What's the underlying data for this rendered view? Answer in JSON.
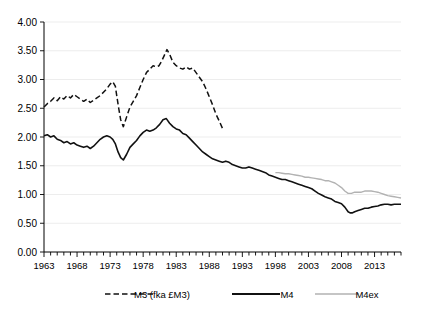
{
  "chart_data": {
    "type": "line",
    "title": "",
    "subtitle": "",
    "xlabel": "",
    "ylabel": "",
    "xlim": [
      1963,
      2017
    ],
    "ylim": [
      0.0,
      4.0
    ],
    "grid": true,
    "legend_position": "bottom",
    "y_ticks": [
      "0.00",
      "0.50",
      "1.00",
      "1.50",
      "2.00",
      "2.50",
      "3.00",
      "3.50",
      "4.00"
    ],
    "y_tick_values": [
      0.0,
      0.5,
      1.0,
      1.5,
      2.0,
      2.5,
      3.0,
      3.5,
      4.0
    ],
    "x_ticks": [
      "1963",
      "1968",
      "1973",
      "1978",
      "1983",
      "1988",
      "1993",
      "1998",
      "2003",
      "2008",
      "2013"
    ],
    "x_tick_values": [
      1963,
      1968,
      1973,
      1978,
      1983,
      1988,
      1993,
      1998,
      2003,
      2008,
      2013
    ],
    "x_minor_tick_values": [
      1964,
      1965,
      1966,
      1967,
      1969,
      1970,
      1971,
      1972,
      1974,
      1975,
      1976,
      1977,
      1979,
      1980,
      1981,
      1982,
      1984,
      1985,
      1986,
      1987,
      1989,
      1990,
      1991,
      1992,
      1994,
      1995,
      1996,
      1997,
      1999,
      2000,
      2001,
      2002,
      2004,
      2005,
      2006,
      2007,
      2009,
      2010,
      2011,
      2012,
      2014,
      2015,
      2016,
      2017
    ],
    "series": [
      {
        "name": "M3 (fka £M3)",
        "label": "M3 (fka £M3)",
        "color": "#111111",
        "style": "dashed",
        "x": [
          1963.0,
          1963.5,
          1964.0,
          1964.5,
          1965.0,
          1965.5,
          1966.0,
          1966.5,
          1967.0,
          1967.5,
          1968.0,
          1968.5,
          1969.0,
          1969.5,
          1970.0,
          1970.5,
          1971.0,
          1971.5,
          1972.0,
          1972.5,
          1973.0,
          1973.4,
          1973.8,
          1974.0,
          1974.3,
          1974.6,
          1975.0,
          1975.5,
          1976.0,
          1976.5,
          1977.0,
          1977.5,
          1978.0,
          1978.5,
          1979.0,
          1979.5,
          1980.0,
          1980.4,
          1980.8,
          1981.2,
          1981.6,
          1982.0,
          1982.5,
          1983.0,
          1983.5,
          1984.0,
          1984.5,
          1985.0,
          1985.5,
          1986.0,
          1986.5,
          1987.0,
          1987.5,
          1988.0,
          1988.5,
          1989.0,
          1989.5,
          1990.0
        ],
        "y": [
          2.52,
          2.58,
          2.62,
          2.68,
          2.63,
          2.7,
          2.66,
          2.72,
          2.68,
          2.74,
          2.7,
          2.66,
          2.62,
          2.66,
          2.6,
          2.64,
          2.68,
          2.72,
          2.78,
          2.84,
          2.92,
          2.96,
          2.88,
          2.72,
          2.5,
          2.3,
          2.18,
          2.35,
          2.52,
          2.62,
          2.72,
          2.86,
          3.0,
          3.12,
          3.18,
          3.24,
          3.22,
          3.24,
          3.32,
          3.42,
          3.52,
          3.44,
          3.3,
          3.24,
          3.2,
          3.18,
          3.22,
          3.18,
          3.2,
          3.12,
          3.04,
          2.96,
          2.84,
          2.7,
          2.56,
          2.4,
          2.28,
          2.15
        ]
      },
      {
        "name": "M4",
        "label": "M4",
        "color": "#111111",
        "style": "solid",
        "x": [
          1963.0,
          1963.5,
          1964.0,
          1964.5,
          1965.0,
          1965.5,
          1966.0,
          1966.5,
          1967.0,
          1967.5,
          1968.0,
          1968.5,
          1969.0,
          1969.5,
          1970.0,
          1970.5,
          1971.0,
          1971.5,
          1972.0,
          1972.5,
          1973.0,
          1973.4,
          1973.8,
          1974.2,
          1974.6,
          1975.0,
          1975.5,
          1976.0,
          1976.5,
          1977.0,
          1977.5,
          1978.0,
          1978.5,
          1979.0,
          1979.5,
          1980.0,
          1980.5,
          1981.0,
          1981.5,
          1982.0,
          1982.5,
          1983.0,
          1983.5,
          1984.0,
          1984.5,
          1985.0,
          1985.5,
          1986.0,
          1986.5,
          1987.0,
          1987.5,
          1988.0,
          1988.5,
          1989.0,
          1989.5,
          1990.0,
          1990.5,
          1991.0,
          1991.5,
          1992.0,
          1992.5,
          1993.0,
          1993.5,
          1994.0,
          1994.5,
          1995.0,
          1995.5,
          1996.0,
          1996.5,
          1997.0,
          1997.5,
          1998.0,
          1998.5,
          1999.0,
          1999.5,
          2000.0,
          2000.5,
          2001.0,
          2001.5,
          2002.0,
          2002.5,
          2003.0,
          2003.5,
          2004.0,
          2004.5,
          2005.0,
          2005.5,
          2006.0,
          2006.5,
          2007.0,
          2007.5,
          2008.0,
          2008.5,
          2009.0,
          2009.3,
          2009.6,
          2010.0,
          2010.5,
          2011.0,
          2011.5,
          2012.0,
          2012.5,
          2013.0,
          2013.5,
          2014.0,
          2014.5,
          2015.0,
          2015.5,
          2016.0,
          2016.5,
          2017.0
        ],
        "y": [
          2.02,
          2.04,
          2.0,
          2.02,
          1.96,
          1.94,
          1.9,
          1.92,
          1.88,
          1.9,
          1.86,
          1.84,
          1.82,
          1.84,
          1.8,
          1.84,
          1.9,
          1.96,
          2.0,
          2.02,
          2.0,
          1.96,
          1.88,
          1.74,
          1.64,
          1.6,
          1.7,
          1.82,
          1.88,
          1.94,
          2.02,
          2.08,
          2.12,
          2.1,
          2.12,
          2.16,
          2.22,
          2.3,
          2.32,
          2.24,
          2.18,
          2.14,
          2.12,
          2.06,
          2.04,
          1.98,
          1.92,
          1.86,
          1.8,
          1.74,
          1.7,
          1.66,
          1.62,
          1.6,
          1.58,
          1.56,
          1.58,
          1.56,
          1.52,
          1.5,
          1.48,
          1.46,
          1.46,
          1.48,
          1.46,
          1.44,
          1.42,
          1.4,
          1.38,
          1.34,
          1.32,
          1.3,
          1.28,
          1.26,
          1.26,
          1.24,
          1.22,
          1.2,
          1.18,
          1.16,
          1.14,
          1.12,
          1.1,
          1.06,
          1.02,
          0.99,
          0.96,
          0.94,
          0.92,
          0.88,
          0.86,
          0.84,
          0.78,
          0.7,
          0.68,
          0.68,
          0.7,
          0.72,
          0.74,
          0.76,
          0.76,
          0.78,
          0.79,
          0.8,
          0.82,
          0.83,
          0.83,
          0.82,
          0.83,
          0.83,
          0.83
        ]
      },
      {
        "name": "M4ex",
        "label": "M4ex",
        "color": "#b2b2b2",
        "style": "solid",
        "x": [
          1998.0,
          1998.5,
          1999.0,
          1999.5,
          2000.0,
          2000.5,
          2001.0,
          2001.5,
          2002.0,
          2002.5,
          2003.0,
          2003.5,
          2004.0,
          2004.5,
          2005.0,
          2005.5,
          2006.0,
          2006.5,
          2007.0,
          2007.5,
          2008.0,
          2008.5,
          2009.0,
          2009.5,
          2010.0,
          2010.5,
          2011.0,
          2011.5,
          2012.0,
          2012.5,
          2013.0,
          2013.5,
          2014.0,
          2014.5,
          2015.0,
          2015.5,
          2016.0,
          2016.5,
          2017.0
        ],
        "y": [
          1.38,
          1.38,
          1.37,
          1.36,
          1.36,
          1.35,
          1.34,
          1.33,
          1.32,
          1.3,
          1.3,
          1.29,
          1.28,
          1.27,
          1.26,
          1.24,
          1.24,
          1.22,
          1.2,
          1.16,
          1.12,
          1.06,
          1.02,
          1.02,
          1.04,
          1.04,
          1.04,
          1.06,
          1.06,
          1.06,
          1.05,
          1.04,
          1.02,
          1.0,
          0.98,
          0.97,
          0.96,
          0.95,
          0.94
        ]
      }
    ]
  },
  "legend": {
    "items": [
      {
        "label": "M3 (fka £M3)"
      },
      {
        "label": "M4"
      },
      {
        "label": "M4ex"
      }
    ]
  }
}
